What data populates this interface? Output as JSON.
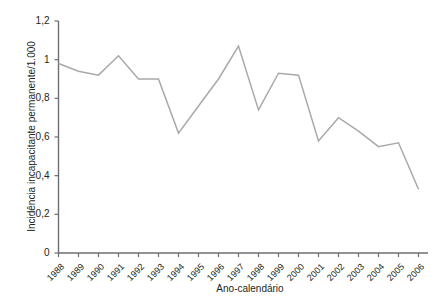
{
  "chart_data": {
    "type": "line",
    "title": "",
    "xlabel": "Ano-calendário",
    "ylabel": "Incidência incapacitante permanente/1.000",
    "categories": [
      "1988",
      "1989",
      "1990",
      "1991",
      "1992",
      "1993",
      "1994",
      "1995",
      "1996",
      "1997",
      "1998",
      "1999",
      "2000",
      "2001",
      "2002",
      "2003",
      "2004",
      "2005",
      "2006"
    ],
    "values": [
      0.98,
      0.94,
      0.92,
      1.02,
      0.9,
      0.9,
      0.62,
      0.76,
      0.9,
      1.07,
      0.74,
      0.93,
      0.92,
      0.58,
      0.7,
      0.63,
      0.55,
      0.57,
      0.33
    ],
    "series": [
      {
        "name": "Incidência incapacitante permanente/1.000",
        "color": "#a7a9ac",
        "values": [
          0.98,
          0.94,
          0.92,
          1.02,
          0.9,
          0.9,
          0.62,
          0.76,
          0.9,
          1.07,
          0.74,
          0.93,
          0.92,
          0.58,
          0.7,
          0.63,
          0.55,
          0.57,
          0.33
        ]
      }
    ],
    "ylim": [
      0,
      1.2
    ],
    "yticks": [
      0,
      0.2,
      0.4,
      0.6,
      0.8,
      1.0,
      1.2
    ],
    "ytick_labels": [
      "0",
      "0,2",
      "0,4",
      "0,6",
      "0,8",
      "1",
      "1,2"
    ],
    "grid": false,
    "legend": "none",
    "line_color": "#a7a9ac",
    "axis_color": "#6d6e71"
  }
}
